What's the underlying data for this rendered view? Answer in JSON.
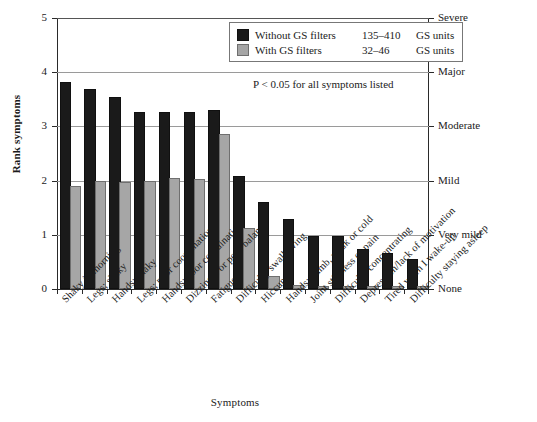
{
  "chart_data": {
    "type": "bar",
    "title": "",
    "xlabel": "Symptoms",
    "ylabel": "Rank symptoms",
    "ylim": [
      0,
      5
    ],
    "yticks": [
      0,
      1,
      2,
      3,
      4,
      5
    ],
    "ytick_labels": [
      "0",
      "1",
      "2",
      "3",
      "4",
      "5"
    ],
    "y2_tick_labels": [
      "None",
      "Very mild",
      "Mild",
      "Moderate",
      "Major",
      "Severe"
    ],
    "grid": true,
    "legend_position": "top-right",
    "categories": [
      "Shaky in morning",
      "Legs; shaky",
      "Hands; shaky",
      "Legs; poor coordination",
      "Hands; poor coordination",
      "Dizziness or poor balance",
      "Fatigue",
      "Difficulty swallowing",
      "Hiccups",
      "Hands; numb, weak or cold",
      "Joint stiffness or pain",
      "Difficulty concentrating",
      "Depression/lack of motivation",
      "Tired when I wake-up",
      "Difficulty staying asleep"
    ],
    "series": [
      {
        "name": "Without GS filters",
        "range": "135–410",
        "units": "GS units",
        "color": "#1a1a1a",
        "values": [
          3.78,
          3.66,
          3.51,
          3.23,
          3.23,
          3.23,
          3.27,
          2.05,
          1.56,
          1.25,
          0.95,
          0.95,
          0.7,
          0.62,
          0.52
        ]
      },
      {
        "name": "With GS filters",
        "range": "32–46",
        "units": "GS units",
        "color": "#a6a6a6",
        "values": [
          1.87,
          1.96,
          1.93,
          1.96,
          2.02,
          1.99,
          2.82,
          1.08,
          0.2,
          0.03,
          0.02,
          0.02,
          0.02,
          0.02,
          0.02
        ]
      }
    ],
    "annotation": "P < 0.05 for all symptoms listed"
  },
  "legend": {
    "rows": [
      {
        "name": "Without GS filters",
        "range": "135–410",
        "units": "GS units"
      },
      {
        "name": "With GS filters",
        "range": "32–46",
        "units": "GS units"
      }
    ]
  }
}
